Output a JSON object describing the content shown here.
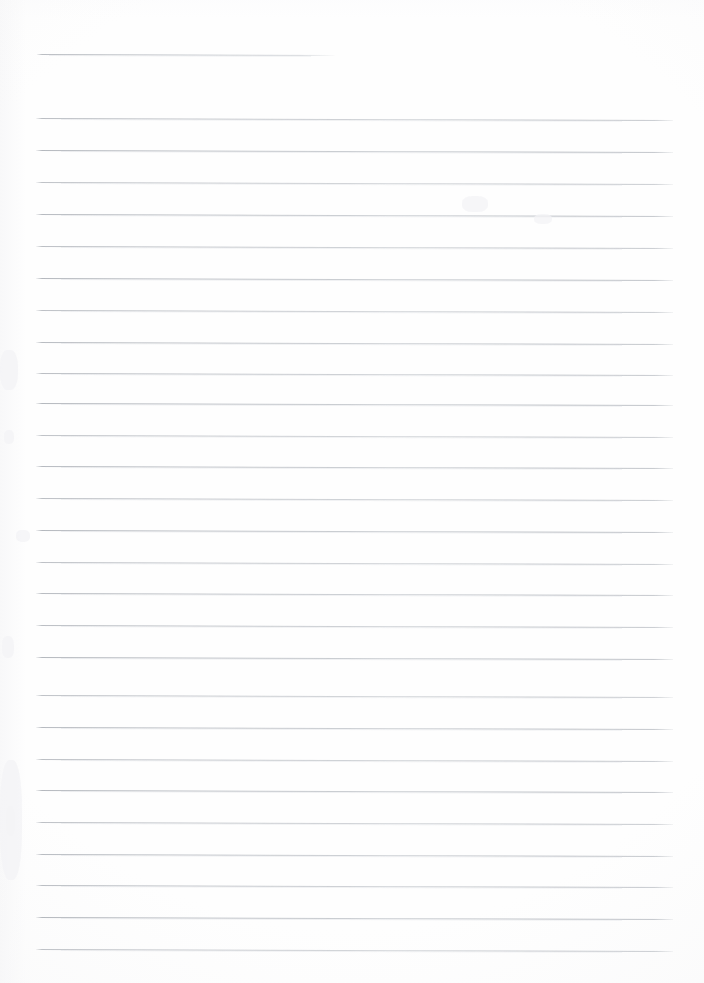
{
  "document": {
    "title": "Scanned lined notebook page",
    "page_width": 704,
    "page_height": 983,
    "background_color": "#fefefe",
    "content_text": "",
    "note": "Blank ruled paper scan — no written or printed text present"
  },
  "ruling": {
    "line_color": "#b4b8be",
    "line_thickness_px": 1,
    "line_spacing_px": 31.95,
    "left_margin_px": 36,
    "right_edge_px": 673,
    "skew_deg": 0.17,
    "total_lines": 28,
    "short_first_line": {
      "label": "header rule",
      "x_start": 37,
      "x_end": 335,
      "y": 54
    },
    "full_lines": [
      {
        "y": 118
      },
      {
        "y": 150
      },
      {
        "y": 182
      },
      {
        "y": 214
      },
      {
        "y": 246
      },
      {
        "y": 278
      },
      {
        "y": 310
      },
      {
        "y": 342
      },
      {
        "y": 373
      },
      {
        "y": 403
      },
      {
        "y": 435
      },
      {
        "y": 466
      },
      {
        "y": 498
      },
      {
        "y": 530
      },
      {
        "y": 562
      },
      {
        "y": 593
      },
      {
        "y": 625
      },
      {
        "y": 657
      },
      {
        "y": 695
      },
      {
        "y": 727
      },
      {
        "y": 759
      },
      {
        "y": 790
      },
      {
        "y": 822
      },
      {
        "y": 854
      },
      {
        "y": 885
      },
      {
        "y": 917
      },
      {
        "y": 949
      }
    ]
  },
  "artifacts": {
    "specks": [
      {
        "x": 4,
        "y": 430,
        "w": 10,
        "h": 14
      },
      {
        "x": 2,
        "y": 636,
        "w": 12,
        "h": 22
      },
      {
        "x": 6,
        "y": 806,
        "w": 9,
        "h": 30
      },
      {
        "x": 462,
        "y": 196,
        "w": 26,
        "h": 16
      },
      {
        "x": 534,
        "y": 214,
        "w": 18,
        "h": 10
      },
      {
        "x": 16,
        "y": 530,
        "w": 14,
        "h": 12
      },
      {
        "x": 0,
        "y": 350,
        "w": 18,
        "h": 40
      },
      {
        "x": 0,
        "y": 760,
        "w": 22,
        "h": 120
      }
    ]
  }
}
